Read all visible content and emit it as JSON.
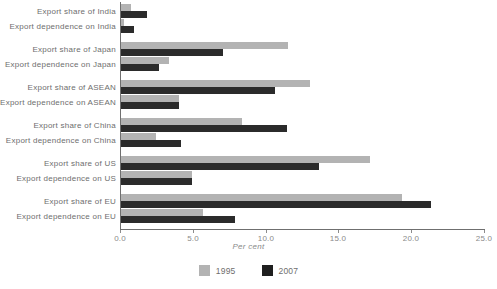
{
  "chart_data": {
    "type": "bar",
    "orientation": "horizontal",
    "title": "",
    "xlabel": "Per cent",
    "ylabel": "",
    "xlim": [
      0.0,
      25.0
    ],
    "xticks": [
      "0.0",
      "5.0",
      "10.0",
      "15.0",
      "20.0",
      "25.0"
    ],
    "xtick_values": [
      0.0,
      5.0,
      10.0,
      15.0,
      20.0,
      25.0
    ],
    "grid": false,
    "legend_position": "bottom-center",
    "categories": [
      "Export share of India",
      "Export dependence on India",
      "Export share of Japan",
      "Export dependence on Japan",
      "Export share of ASEAN",
      "Export dependence on ASEAN",
      "Export share of China",
      "Export dependence on China",
      "Export share of US",
      "Export dependence on US",
      "Export share of EU",
      "Export dependence on EU"
    ],
    "series": [
      {
        "name": "1995",
        "color": "#b3b3b3",
        "values": [
          0.7,
          0.2,
          11.5,
          3.3,
          13.0,
          4.0,
          8.3,
          2.4,
          17.1,
          4.9,
          19.3,
          5.6
        ]
      },
      {
        "name": "2007",
        "color": "#2b2b2b",
        "values": [
          1.8,
          0.9,
          7.0,
          2.6,
          10.6,
          4.0,
          11.4,
          4.1,
          13.6,
          4.9,
          21.3,
          7.8
        ]
      }
    ],
    "groups": [
      {
        "label": "India",
        "rows": [
          0,
          1
        ]
      },
      {
        "label": "Japan",
        "rows": [
          2,
          3
        ]
      },
      {
        "label": "ASEAN",
        "rows": [
          4,
          5
        ]
      },
      {
        "label": "China",
        "rows": [
          6,
          7
        ]
      },
      {
        "label": "US",
        "rows": [
          8,
          9
        ]
      },
      {
        "label": "EU",
        "rows": [
          10,
          11
        ]
      }
    ]
  },
  "legend": {
    "items": [
      {
        "label": "1995",
        "color": "#b3b3b3"
      },
      {
        "label": "2007",
        "color": "#1f1f1f"
      }
    ]
  }
}
